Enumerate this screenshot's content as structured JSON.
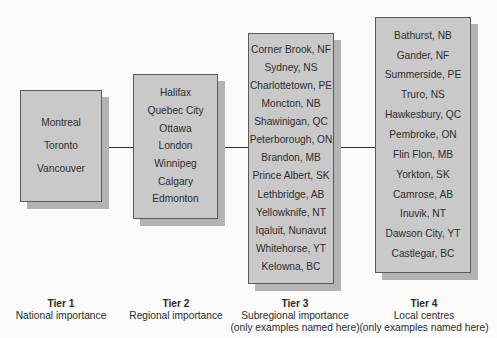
{
  "diagram": {
    "type": "hierarchy",
    "tiers": [
      {
        "name": "Tier 1",
        "description": "National importance",
        "note": "",
        "cities": [
          "Montreal",
          "Toronto",
          "Vancouver"
        ]
      },
      {
        "name": "Tier 2",
        "description": "Regional importance",
        "note": "",
        "cities": [
          "Halifax",
          "Quebec City",
          "Ottawa",
          "London",
          "Winnipeg",
          "Calgary",
          "Edmonton"
        ]
      },
      {
        "name": "Tier 3",
        "description": "Subregional importance",
        "note": "(only examples named here)",
        "cities": [
          "Corner Brook, NF",
          "Sydney, NS",
          "Charlottetown, PE",
          "Moncton, NB",
          "Shawinigan, QC",
          "Peterborough, ON",
          "Brandon, MB",
          "Prince Albert, SK",
          "Lethbridge, AB",
          "Yellowknife, NT",
          "Iqaluit, Nunavut",
          "Whitehorse, YT",
          "Kelowna, BC"
        ]
      },
      {
        "name": "Tier 4",
        "description": "Local centres",
        "note": "(only examples named here)",
        "cities": [
          "Bathurst, NB",
          "Gander, NF",
          "Summerside, PE",
          "Truro, NS",
          "Hawkesbury, QC",
          "Pembroke, ON",
          "Flin Flon, MB",
          "Yorkton, SK",
          "Camrose, AB",
          "Inuvik, NT",
          "Dawson City, YT",
          "Castlegar, BC"
        ]
      }
    ],
    "colors": {
      "box_fill": "#c9c9c9",
      "box_shadow": "#b3b3b3",
      "box_border": "#5a5a5a",
      "connector": "#2b2b2b",
      "background": "#fbfbfb"
    }
  }
}
